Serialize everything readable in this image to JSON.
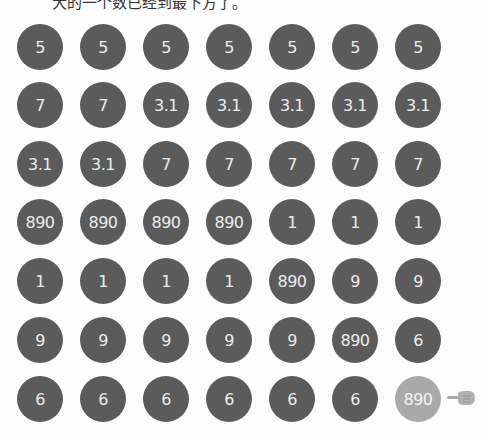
{
  "caption": "大的一个数已经到最下方了。",
  "colors": {
    "ball": "#5b5b5b",
    "highlight": "#a9a9a9",
    "text": "#ececec"
  },
  "grid": {
    "rows": [
      [
        "5",
        "5",
        "5",
        "5",
        "5",
        "5",
        "5"
      ],
      [
        "7",
        "7",
        "3.1",
        "3.1",
        "3.1",
        "3.1",
        "3.1"
      ],
      [
        "3.1",
        "3.1",
        "7",
        "7",
        "7",
        "7",
        "7"
      ],
      [
        "890",
        "890",
        "890",
        "890",
        "1",
        "1",
        "1"
      ],
      [
        "1",
        "1",
        "1",
        "1",
        "890",
        "9",
        "9"
      ],
      [
        "9",
        "9",
        "9",
        "9",
        "9",
        "890",
        "6"
      ],
      [
        "6",
        "6",
        "6",
        "6",
        "6",
        "6",
        "890"
      ]
    ],
    "highlighted": {
      "row": 6,
      "col": 6
    }
  },
  "pointer": {
    "icon": "pointing-hand-icon"
  }
}
